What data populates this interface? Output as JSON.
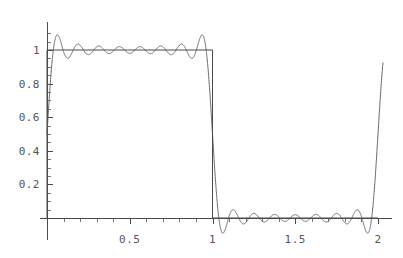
{
  "chart_data": {
    "type": "line",
    "title": "",
    "subtitle": "",
    "xlabel": "",
    "ylabel": "",
    "xlim": [
      0,
      2.03
    ],
    "ylim": [
      -0.13,
      1.16
    ],
    "grid": false,
    "legend": "none",
    "background_color": "#ffffff",
    "x_ticks_major": [
      0.5,
      1,
      1.5,
      2
    ],
    "x_tick_labels": [
      "0.5",
      "1",
      "1.5",
      "2"
    ],
    "x_ticks_minor": [
      0.1,
      0.2,
      0.3,
      0.4,
      0.6,
      0.7,
      0.8,
      0.9,
      1.1,
      1.2,
      1.3,
      1.4,
      1.6,
      1.7,
      1.8,
      1.9
    ],
    "y_ticks_major": [
      0.2,
      0.4,
      0.6,
      0.8,
      1
    ],
    "y_tick_labels": [
      "0.2",
      "0.4",
      "0.6",
      "0.8",
      "1"
    ],
    "y_ticks_minor": [
      0.05,
      0.1,
      0.15,
      0.25,
      0.3,
      0.35,
      0.45,
      0.5,
      0.55,
      0.65,
      0.7,
      0.75,
      0.85,
      0.9,
      0.95,
      1.05,
      1.1
    ],
    "series": [
      {
        "name": "square-wave",
        "kind": "exact",
        "color": "#4a4a4a",
        "description": "Square wave, period 2: value 1 on [0,1), value 0 on [1,2)",
        "vertices": [
          [
            0,
            0
          ],
          [
            0,
            1
          ],
          [
            1,
            1
          ],
          [
            1,
            0
          ],
          [
            2,
            0
          ]
        ]
      },
      {
        "name": "fourier-partial-sum",
        "kind": "approximation",
        "color": "#666666",
        "description": "Truncated Fourier series of the square wave showing Gibbs overshoot ripples",
        "n_terms": 8,
        "harmonics": [
          1,
          3,
          5,
          7,
          9,
          11,
          13,
          15
        ],
        "mean_level": 0.5,
        "amplitude_coefficient": 0.6366197723675814,
        "overshoot_peak": 1.089,
        "undershoot_min": -0.089,
        "value_at_x0": 0.5,
        "value_at_x1": 0.5,
        "value_at_x2": 0.5
      }
    ],
    "annotations": []
  },
  "axes": {
    "origin_px": {
      "x": 47,
      "y": 218
    },
    "x_unit_px": 165.5,
    "y_unit_px": 168,
    "x_axis_end_px": 392,
    "y_axis_top_px": 22,
    "y_axis_bottom_px": 240
  }
}
